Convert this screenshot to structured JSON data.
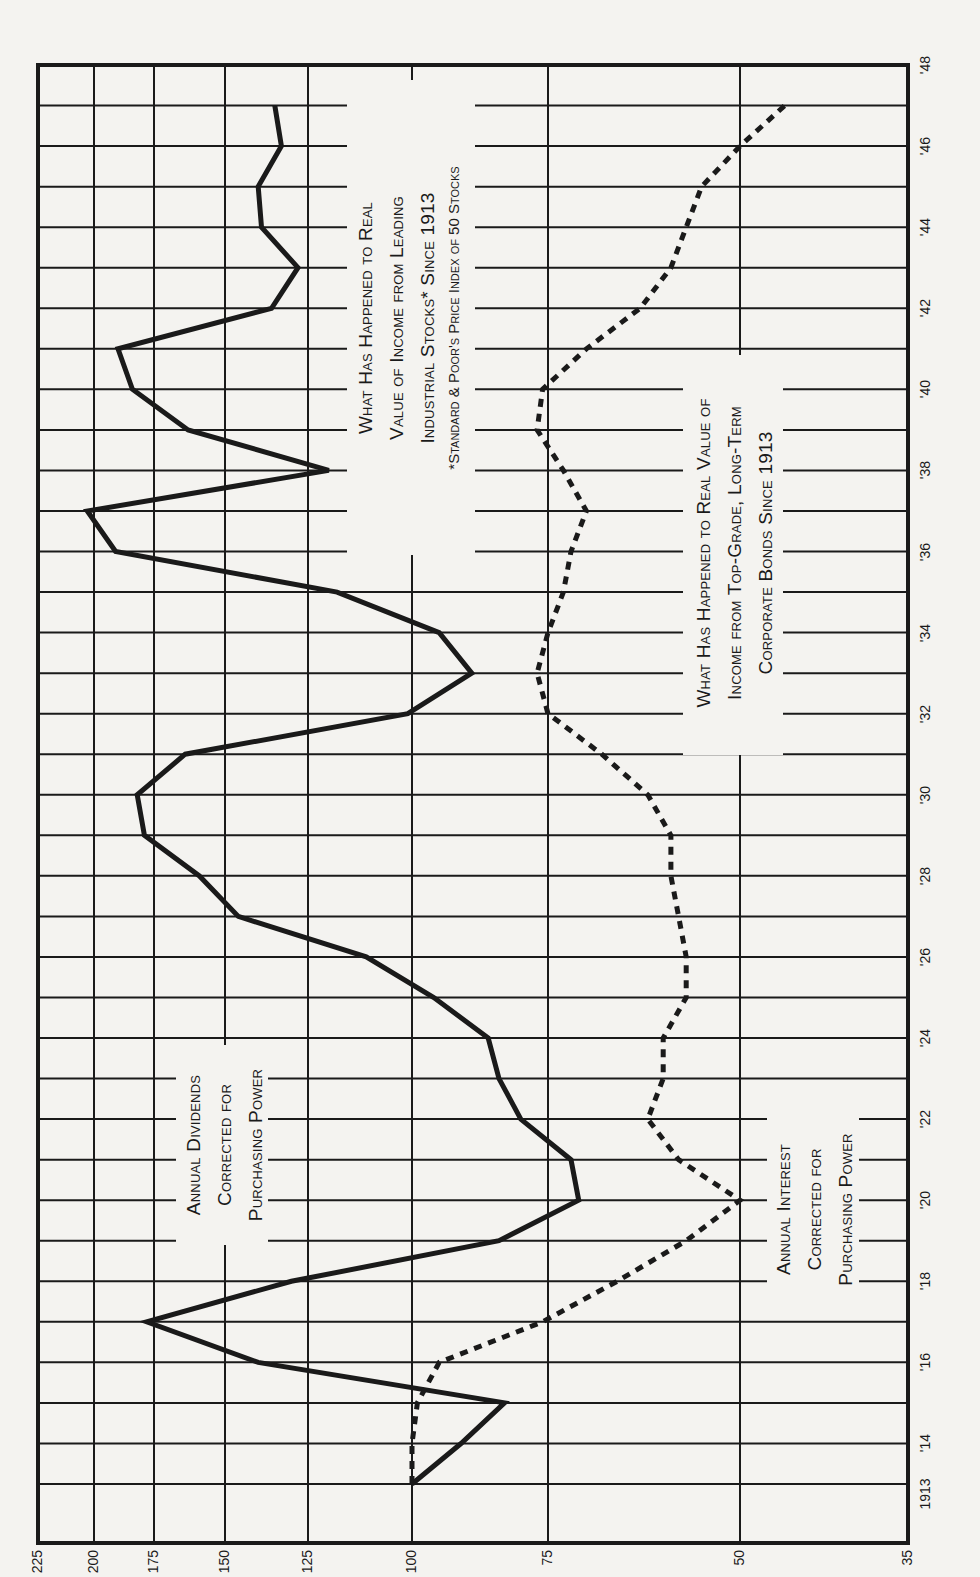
{
  "chart_data": {
    "type": "line",
    "orientation": "rotated-90-ccw",
    "title": "What Has Happened to Real Value of Income from Leading Industrial Stocks* Since 1913",
    "x": [
      1913,
      1914,
      1915,
      1916,
      1917,
      1918,
      1919,
      1920,
      1921,
      1922,
      1923,
      1924,
      1925,
      1926,
      1927,
      1928,
      1929,
      1930,
      1931,
      1932,
      1933,
      1934,
      1935,
      1936,
      1937,
      1938,
      1939,
      1940,
      1941,
      1942,
      1943,
      1944,
      1945,
      1946,
      1947
    ],
    "x_ticks": [
      "1913",
      "'14",
      "'16",
      "'18",
      "'20",
      "'22",
      "'24",
      "'26",
      "'28",
      "'30",
      "'32",
      "'34",
      "'36",
      "'38",
      "'40",
      "'42",
      "'44",
      "'46",
      "'48"
    ],
    "x_tick_years": [
      1913,
      1914,
      1916,
      1918,
      1920,
      1922,
      1924,
      1926,
      1928,
      1930,
      1932,
      1934,
      1936,
      1938,
      1940,
      1942,
      1944,
      1946,
      1948
    ],
    "y_ticks": [
      225,
      200,
      175,
      150,
      125,
      100,
      75,
      50,
      35
    ],
    "ylim": [
      35,
      225
    ],
    "y_scale": "ratio (non-uniform)",
    "grid": true,
    "series": [
      {
        "name": "Annual Dividends Corrected for Purchasing Power",
        "style": "solid",
        "values": [
          100,
          91,
          83,
          140,
          178,
          130,
          84,
          71,
          72,
          80,
          84,
          86,
          96,
          111,
          146,
          159,
          179,
          182,
          164,
          101,
          89,
          95,
          118,
          191,
          203,
          120,
          163,
          184,
          190,
          136,
          128,
          139,
          140,
          133,
          135
        ]
      },
      {
        "name": "Annual Interest Corrected for Purchasing Power",
        "style": "dotted",
        "values": [
          100,
          100,
          99,
          95,
          76,
          66,
          57,
          50,
          58,
          62,
          60,
          60,
          57,
          57,
          58,
          59,
          59,
          62,
          68,
          75,
          77,
          75,
          73,
          72,
          70,
          73,
          77,
          76,
          70,
          63,
          59,
          57,
          55,
          50,
          46
        ]
      }
    ],
    "annotations": {
      "stocks_title": [
        "What Has Happened to Real",
        "Value of Income from Leading",
        "Industrial Stocks* Since 1913"
      ],
      "stocks_footnote": "*Standard & Poor's Price Index of 50 Stocks",
      "bonds_title": [
        "What Has Happened to Real Value of",
        "Income from Top-Grade, Long-Term",
        "Corporate Bonds Since 1913"
      ],
      "dividends_label": [
        "Annual Dividends",
        "Corrected for",
        "Purchasing Power"
      ],
      "interest_label": [
        "Annual Interest",
        "Corrected for",
        "Purchasing Power"
      ]
    },
    "colors": {
      "line": "#1a1a1a",
      "grid": "#1a1a1a",
      "background": "#f4f3f0"
    }
  }
}
